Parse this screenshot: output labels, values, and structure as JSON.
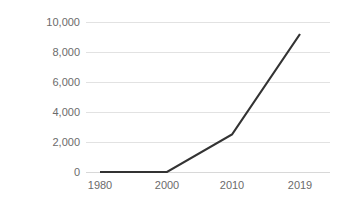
{
  "chart_data": {
    "type": "line",
    "title": "",
    "subtitle": "",
    "xlabel": "",
    "ylabel": "",
    "categories": [
      "1980",
      "2000",
      "2010",
      "2019"
    ],
    "x_tick_labels": [
      "1980",
      "2000",
      "2010",
      "2019"
    ],
    "y_tick_labels": [
      "0",
      "2,000",
      "4,000",
      "6,000",
      "8,000",
      "10,000"
    ],
    "y_ticks": [
      0,
      2000,
      4000,
      6000,
      8000,
      10000
    ],
    "ylim": [
      0,
      10000
    ],
    "grid": "horizontal",
    "legend": "none",
    "series": [
      {
        "name": "",
        "values": [
          0,
          0,
          2500,
          9200
        ]
      }
    ],
    "colors": {
      "line": "#333333",
      "gridline": "#e2e2e2",
      "axis": "#d8d8d8",
      "tick_text": "#6b6b6b",
      "background": "#ffffff"
    }
  }
}
